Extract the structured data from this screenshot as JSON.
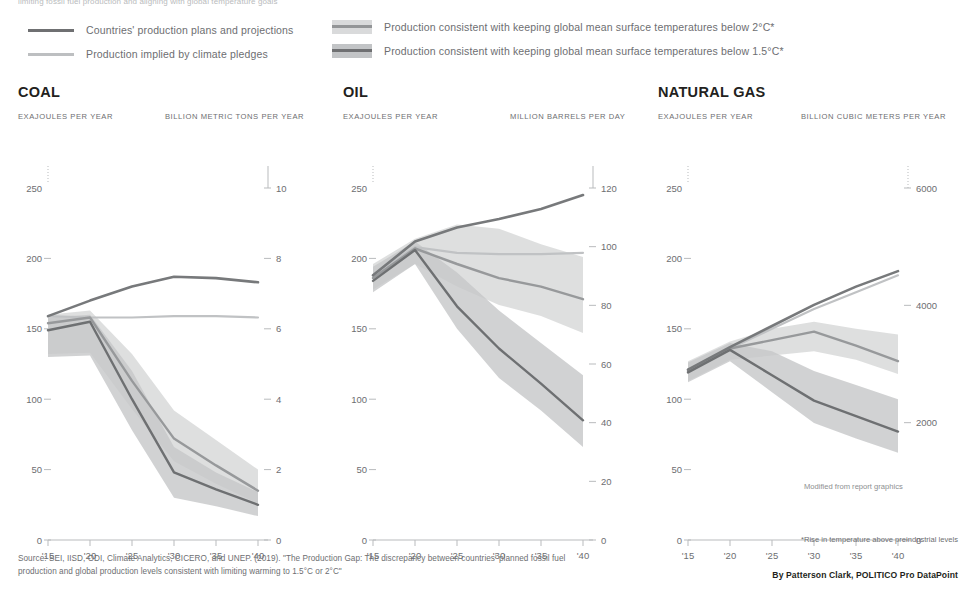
{
  "top_clipped_text": "limiting fossil fuel production and aligning with global temperature goals",
  "legend": {
    "items": [
      {
        "id": "plans",
        "type": "line",
        "label": "Countries' production plans and projections",
        "color": "#6f7072"
      },
      {
        "id": "pledges",
        "type": "line",
        "label": "Production implied by climate pledges",
        "color": "#b6b8ba"
      },
      {
        "id": "two_deg",
        "type": "band",
        "label": "Production consistent with keeping global mean surface temperatures below 2°C*",
        "band_color": "#d6d7d8",
        "line_color": "#8c8e90"
      },
      {
        "id": "one_five_deg",
        "type": "band",
        "label": "Production consistent with keeping global mean surface temperatures below 1.5°C*",
        "band_color": "#bbbdbf",
        "line_color": "#6f7072"
      }
    ]
  },
  "note_modified": "Modified from report graphics",
  "footnote": "*Rise in temperature above preindustrial levels",
  "source": "Source: SEI, IISD, ODI, Climate Analytics, CICERO, and UNEP. (2019). \"The Production Gap: The discrepancy between countries' planned fossil fuel production and global production levels consistent with limiting warming to 1.5°C or 2°C\"",
  "byline": "By Patterson Clark, POLITICO Pro DataPoint",
  "chart_data": [
    {
      "type": "line",
      "id": "coal",
      "title": "COAL",
      "ylabel": "EXAJOULES PER YEAR",
      "ylabel_right": "BILLION METRIC TONS PER YEAR",
      "x": [
        2015,
        2020,
        2025,
        2030,
        2035,
        2040
      ],
      "xlabel": "",
      "xticks": [
        "'15",
        "'20",
        "'25",
        "'30",
        "'35",
        "'40"
      ],
      "ylim": [
        0,
        250
      ],
      "yticks": [
        0,
        50,
        100,
        150,
        200,
        250
      ],
      "ylim_right": [
        0,
        10
      ],
      "yticks_right": [
        0,
        2,
        4,
        6,
        8,
        10
      ],
      "grid": false,
      "legend_position": "top",
      "series": [
        {
          "name": "Countries' production plans and projections",
          "values": [
            159,
            170,
            180,
            187,
            186,
            183
          ]
        },
        {
          "name": "Production implied by climate pledges",
          "values": [
            159,
            158,
            158,
            159,
            159,
            158
          ]
        },
        {
          "name": "Production consistent with below 2°C",
          "values": [
            154,
            158,
            113,
            72,
            53,
            35
          ],
          "lower": [
            132,
            133,
            93,
            56,
            40,
            26
          ],
          "upper": [
            160,
            163,
            132,
            92,
            71,
            50
          ]
        },
        {
          "name": "Production consistent with below 1.5°C",
          "values": [
            149,
            155,
            100,
            48,
            36,
            25
          ],
          "lower": [
            130,
            131,
            78,
            30,
            24,
            17
          ],
          "upper": [
            158,
            160,
            120,
            66,
            48,
            34
          ]
        }
      ]
    },
    {
      "type": "line",
      "id": "oil",
      "title": "OIL",
      "ylabel": "EXAJOULES PER YEAR",
      "ylabel_right": "MILLION BARRELS PER DAY",
      "x": [
        2015,
        2020,
        2025,
        2030,
        2035,
        2040
      ],
      "xlabel": "",
      "xticks": [
        "'15",
        "'20",
        "'25",
        "'30",
        "'35",
        "'40"
      ],
      "ylim": [
        0,
        250
      ],
      "yticks": [
        0,
        50,
        100,
        150,
        200,
        250
      ],
      "ylim_right": [
        0,
        120
      ],
      "yticks_right": [
        0,
        20,
        40,
        60,
        80,
        100,
        120
      ],
      "grid": false,
      "legend_position": "top",
      "series": [
        {
          "name": "Countries' production plans and projections",
          "values": [
            188,
            212,
            222,
            228,
            235,
            245
          ]
        },
        {
          "name": "Production implied by climate pledges",
          "values": [
            188,
            208,
            204,
            203,
            203,
            204
          ]
        },
        {
          "name": "Production consistent with below 2°C",
          "values": [
            186,
            207,
            196,
            186,
            180,
            171
          ],
          "lower": [
            178,
            196,
            180,
            167,
            159,
            147
          ],
          "upper": [
            196,
            214,
            224,
            221,
            210,
            201
          ]
        },
        {
          "name": "Production consistent with below 1.5°C",
          "values": [
            184,
            206,
            166,
            136,
            111,
            85
          ],
          "lower": [
            176,
            196,
            150,
            115,
            92,
            66
          ],
          "upper": [
            194,
            212,
            190,
            163,
            140,
            117
          ]
        }
      ]
    },
    {
      "type": "line",
      "id": "natural_gas",
      "title": "NATURAL GAS",
      "ylabel": "EXAJOULES PER YEAR",
      "ylabel_right": "BILLION CUBIC METERS PER YEAR",
      "x": [
        2015,
        2020,
        2025,
        2030,
        2035,
        2040
      ],
      "xlabel": "",
      "xticks": [
        "'15",
        "'20",
        "'25",
        "'30",
        "'35",
        "'40"
      ],
      "ylim": [
        0,
        250
      ],
      "yticks": [
        0,
        50,
        100,
        150,
        200,
        250
      ],
      "ylim_right": [
        0,
        6000
      ],
      "yticks_right": [
        0,
        2000,
        4000,
        6000
      ],
      "grid": false,
      "legend_position": "top",
      "series": [
        {
          "name": "Countries' production plans and projections",
          "values": [
            121,
            137,
            152,
            167,
            180,
            191
          ]
        },
        {
          "name": "Production implied by climate pledges",
          "values": [
            121,
            136,
            150,
            164,
            176,
            188
          ]
        },
        {
          "name": "Production consistent with below 2°C",
          "values": [
            120,
            136,
            142,
            148,
            138,
            127
          ],
          "lower": [
            113,
            128,
            131,
            134,
            128,
            118
          ],
          "upper": [
            127,
            141,
            150,
            155,
            150,
            146
          ]
        },
        {
          "name": "Production consistent with below 1.5°C",
          "values": [
            119,
            135,
            117,
            99,
            88,
            77
          ],
          "lower": [
            112,
            127,
            105,
            83,
            72,
            62
          ],
          "upper": [
            126,
            140,
            134,
            120,
            110,
            100
          ]
        }
      ]
    }
  ]
}
